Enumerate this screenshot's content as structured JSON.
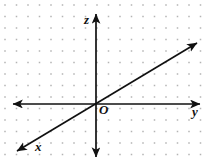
{
  "figure": {
    "type": "3d-coordinate-axes-diagram",
    "background_color": "#ffffff",
    "width": 210,
    "height": 166
  },
  "grid": {
    "name": "dot-grid",
    "dot_color": "#b4b4b4",
    "dot_size": 1.5,
    "spacing": 11.5,
    "offset_x": 5,
    "offset_y": 5
  },
  "axes": {
    "stroke_color": "#111111",
    "stroke_width": 1.6,
    "origin": {
      "x": 96,
      "y": 104
    },
    "items": [
      {
        "name": "z-axis",
        "label": "z",
        "orientation": "vertical",
        "double_headed": true,
        "from": {
          "x": 96,
          "y": 14
        },
        "to": {
          "x": 96,
          "y": 157
        },
        "label_position": {
          "x": 84,
          "y": 13
        }
      },
      {
        "name": "y-axis",
        "label": "y",
        "orientation": "horizontal",
        "double_headed": true,
        "from": {
          "x": 13,
          "y": 104
        },
        "to": {
          "x": 200,
          "y": 104
        },
        "label_position": {
          "x": 192,
          "y": 105
        }
      },
      {
        "name": "x-axis",
        "label": "x",
        "orientation": "diagonal",
        "double_headed": true,
        "from": {
          "x": 197,
          "y": 43
        },
        "to": {
          "x": 17,
          "y": 151
        },
        "label_position": {
          "x": 35,
          "y": 140
        }
      }
    ]
  },
  "origin_marker": {
    "name": "origin-label",
    "label": "O",
    "position": {
      "x": 99,
      "y": 103
    }
  }
}
